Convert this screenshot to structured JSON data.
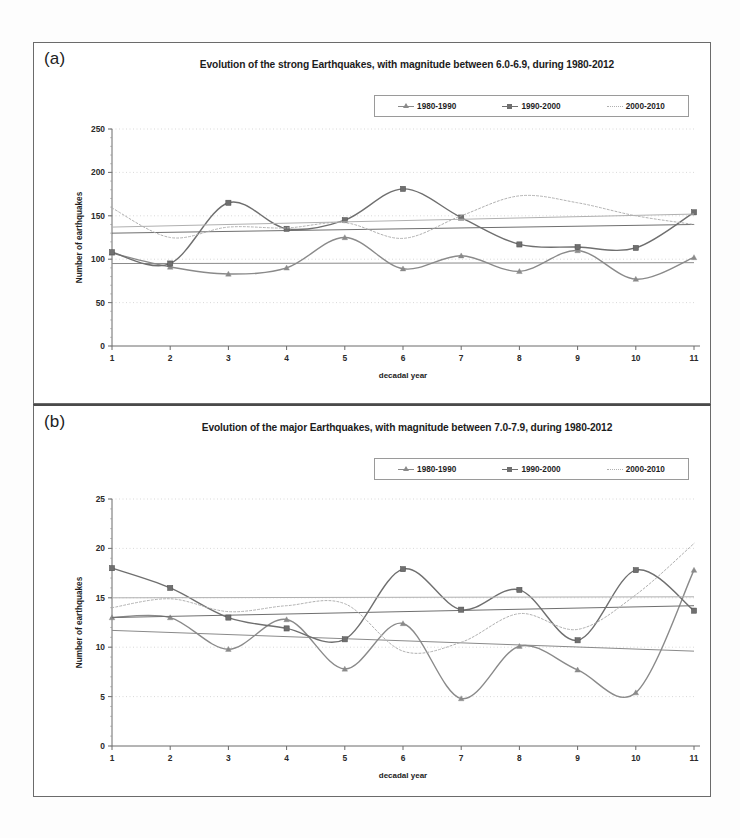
{
  "figure": {
    "panels": [
      {
        "label": "(a)",
        "title": "Evolution of the strong Earthquakes, with magnitude between 6.0-6.9, during 1980-2012",
        "xlabel": "decadal year",
        "ylabel": "Number of earthquakes"
      },
      {
        "label": "(b)",
        "title": "Evolution of the major Earthquakes, with magnitude between 7.0-7.9, during 1980-2012",
        "xlabel": "decadal year",
        "ylabel": "Number of earthquakes"
      }
    ]
  },
  "legend": {
    "items": [
      {
        "label": "1980-1990",
        "marker": "triangle",
        "color": "#8a8a8a"
      },
      {
        "label": "1990-2000",
        "marker": "square",
        "color": "#6f6f6f"
      },
      {
        "label": "2000-2010",
        "marker": "none",
        "color": "#b0b0b0"
      }
    ]
  },
  "chart_data": [
    {
      "type": "line",
      "title": "Evolution of the strong Earthquakes, with magnitude between 6.0-6.9, during 1980-2012",
      "xlabel": "decadal year",
      "ylabel": "Number of earthquakes",
      "categories": [
        1,
        2,
        3,
        4,
        5,
        6,
        7,
        8,
        9,
        10,
        11
      ],
      "xticks": [
        "1",
        "2",
        "3",
        "4",
        "5",
        "6",
        "7",
        "8",
        "9",
        "10",
        "11"
      ],
      "yticks": [
        0,
        50,
        100,
        150,
        200,
        250
      ],
      "ylim": [
        0,
        250
      ],
      "xlim": [
        1,
        11
      ],
      "grid": true,
      "legend_position": "top-right",
      "series": [
        {
          "name": "1980-1990",
          "marker": "triangle",
          "color": "#8a8a8a",
          "values": [
            107,
            91,
            83,
            90,
            125,
            89,
            104,
            86,
            110,
            77,
            102
          ],
          "trend": [
            95,
            96
          ]
        },
        {
          "name": "1990-2000",
          "marker": "square",
          "color": "#6f6f6f",
          "values": [
            108,
            95,
            165,
            135,
            145,
            181,
            148,
            117,
            114,
            113,
            154
          ],
          "trend": [
            130,
            140
          ]
        },
        {
          "name": "2000-2010",
          "marker": "none",
          "color": "#b0b0b0",
          "values": [
            159,
            125,
            137,
            136,
            142,
            124,
            150,
            173,
            165,
            150,
            140
          ],
          "trend": [
            137,
            152
          ]
        }
      ]
    },
    {
      "type": "line",
      "title": "Evolution of the major Earthquakes, with magnitude between 7.0-7.9, during 1980-2012",
      "xlabel": "decadal year",
      "ylabel": "Number of earthquakes",
      "categories": [
        1,
        2,
        3,
        4,
        5,
        6,
        7,
        8,
        9,
        10,
        11
      ],
      "xticks": [
        "1",
        "2",
        "3",
        "4",
        "5",
        "6",
        "7",
        "8",
        "9",
        "10",
        "11"
      ],
      "yticks": [
        0,
        5,
        10,
        15,
        20,
        25
      ],
      "ylim": [
        0,
        25
      ],
      "xlim": [
        1,
        11
      ],
      "grid": true,
      "legend_position": "top-right",
      "series": [
        {
          "name": "1980-1990",
          "marker": "triangle",
          "color": "#8a8a8a",
          "values": [
            13,
            13,
            9.8,
            12.8,
            7.8,
            12.4,
            4.8,
            10.1,
            7.7,
            5.4,
            17.8
          ],
          "trend": [
            11.7,
            9.6
          ]
        },
        {
          "name": "1990-2000",
          "marker": "square",
          "color": "#6f6f6f",
          "values": [
            18,
            16,
            13,
            11.9,
            10.8,
            17.9,
            13.8,
            15.8,
            10.7,
            17.8,
            13.7
          ],
          "trend": [
            13.0,
            14.2
          ]
        },
        {
          "name": "2000-2010",
          "marker": "none",
          "color": "#b0b0b0",
          "values": [
            14,
            14.9,
            13.6,
            14.2,
            14.4,
            9.6,
            10.5,
            13.4,
            11.8,
            15.3,
            20.5
          ],
          "trend": [
            15.0,
            15.1
          ]
        }
      ]
    }
  ]
}
